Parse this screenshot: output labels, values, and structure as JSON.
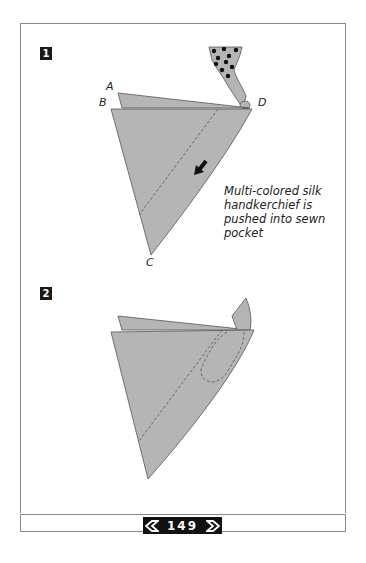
{
  "steps": [
    {
      "number": "1",
      "labels": {
        "A": "A",
        "B": "B",
        "C": "C",
        "D": "D"
      }
    },
    {
      "number": "2"
    }
  ],
  "caption": [
    "Multi-colored silk",
    "handkerchief is",
    "pushed into sewn",
    "pocket"
  ],
  "footer": {
    "page_number": "149",
    "prev_icon": "diamond-left-arrow-icon",
    "next_icon": "diamond-right-arrow-icon"
  },
  "colors": {
    "fabric": "#b5b5b5",
    "fabric_stroke": "#555555",
    "page_box": "#111111",
    "border": "#8a8a8a"
  }
}
